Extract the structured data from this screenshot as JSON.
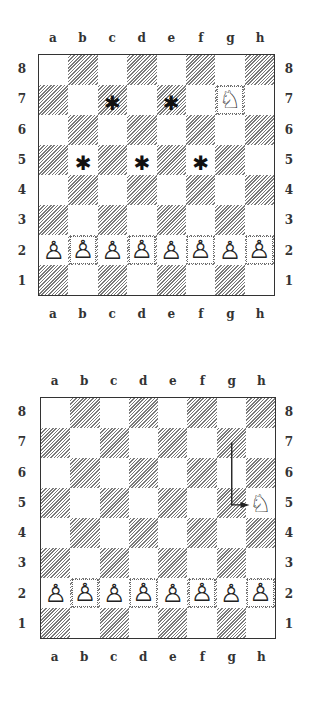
{
  "files": [
    "a",
    "b",
    "c",
    "d",
    "e",
    "f",
    "g",
    "h"
  ],
  "ranks": [
    "8",
    "7",
    "6",
    "5",
    "4",
    "3",
    "2",
    "1"
  ],
  "glyphs": {
    "white-knight": "♘",
    "white-pawn": "♙",
    "target-marker": "✱"
  },
  "diagrams": [
    {
      "id": "diagram-1",
      "description": "Knight on g7 with possible target squares marked",
      "pieces": [
        {
          "square": "g7",
          "piece": "white-knight",
          "glyph": "♘"
        },
        {
          "square": "a2",
          "piece": "white-pawn",
          "glyph": "♙"
        },
        {
          "square": "b2",
          "piece": "white-pawn",
          "glyph": "♙"
        },
        {
          "square": "c2",
          "piece": "white-pawn",
          "glyph": "♙"
        },
        {
          "square": "d2",
          "piece": "white-pawn",
          "glyph": "♙"
        },
        {
          "square": "e2",
          "piece": "white-pawn",
          "glyph": "♙"
        },
        {
          "square": "f2",
          "piece": "white-pawn",
          "glyph": "♙"
        },
        {
          "square": "g2",
          "piece": "white-pawn",
          "glyph": "♙"
        },
        {
          "square": "h2",
          "piece": "white-pawn",
          "glyph": "♙"
        }
      ],
      "markers": [
        {
          "square": "c7",
          "glyph": "✱"
        },
        {
          "square": "e7",
          "glyph": "✱"
        },
        {
          "square": "b5",
          "glyph": "✱"
        },
        {
          "square": "d5",
          "glyph": "✱"
        },
        {
          "square": "f5",
          "glyph": "✱"
        }
      ]
    },
    {
      "id": "diagram-2",
      "description": "Knight move from g7 to h5 shown with L-shaped arrow",
      "pieces": [
        {
          "square": "h5",
          "piece": "white-knight",
          "glyph": "♘"
        },
        {
          "square": "a2",
          "piece": "white-pawn",
          "glyph": "♙"
        },
        {
          "square": "b2",
          "piece": "white-pawn",
          "glyph": "♙"
        },
        {
          "square": "c2",
          "piece": "white-pawn",
          "glyph": "♙"
        },
        {
          "square": "d2",
          "piece": "white-pawn",
          "glyph": "♙"
        },
        {
          "square": "e2",
          "piece": "white-pawn",
          "glyph": "♙"
        },
        {
          "square": "f2",
          "piece": "white-pawn",
          "glyph": "♙"
        },
        {
          "square": "g2",
          "piece": "white-pawn",
          "glyph": "♙"
        },
        {
          "square": "h2",
          "piece": "white-pawn",
          "glyph": "♙"
        }
      ],
      "arrow": {
        "from": "g7",
        "via": "g5",
        "to": "h5"
      }
    }
  ]
}
